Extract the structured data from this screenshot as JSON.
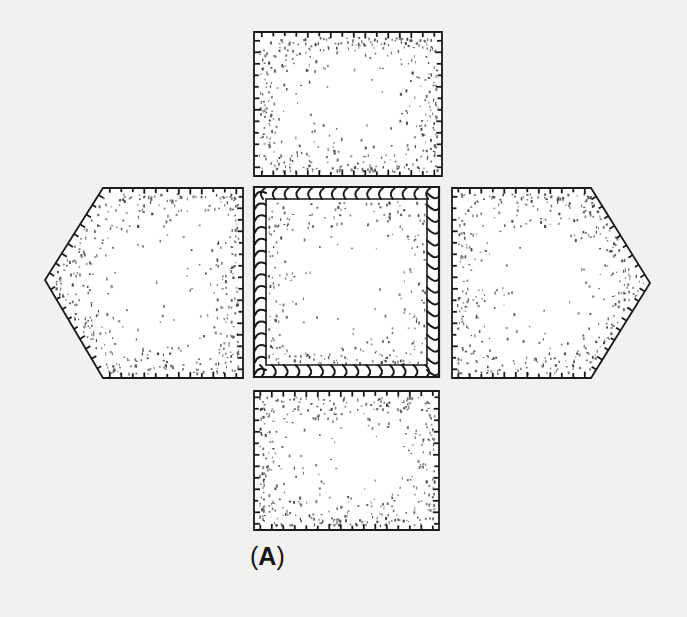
{
  "figure": {
    "label_open": "(",
    "label_letter": "A",
    "label_close": ")"
  },
  "colors": {
    "background": "#f1f1ef",
    "panel_fill": "#ffffff",
    "line": "#1a1a1a",
    "stipple": "#3a3a3a"
  },
  "panels": [
    {
      "name": "top-panel",
      "shape": "rect",
      "points": [
        [
          254,
          32
        ],
        [
          442,
          32
        ],
        [
          442,
          176
        ],
        [
          254,
          176
        ]
      ]
    },
    {
      "name": "left-panel",
      "shape": "pentagon",
      "points": [
        [
          103,
          188
        ],
        [
          243,
          188
        ],
        [
          243,
          378
        ],
        [
          103,
          378
        ],
        [
          45,
          280
        ]
      ]
    },
    {
      "name": "center-panel",
      "shape": "square",
      "points": [
        [
          254,
          187
        ],
        [
          439,
          187
        ],
        [
          439,
          377
        ],
        [
          254,
          377
        ]
      ],
      "edge": "whipstitch"
    },
    {
      "name": "right-panel",
      "shape": "pentagon",
      "points": [
        [
          452,
          188
        ],
        [
          591,
          188
        ],
        [
          650,
          283
        ],
        [
          591,
          378
        ],
        [
          452,
          378
        ]
      ]
    },
    {
      "name": "bottom-panel",
      "shape": "rect",
      "points": [
        [
          254,
          391
        ],
        [
          439,
          391
        ],
        [
          439,
          530
        ],
        [
          254,
          530
        ]
      ]
    }
  ]
}
